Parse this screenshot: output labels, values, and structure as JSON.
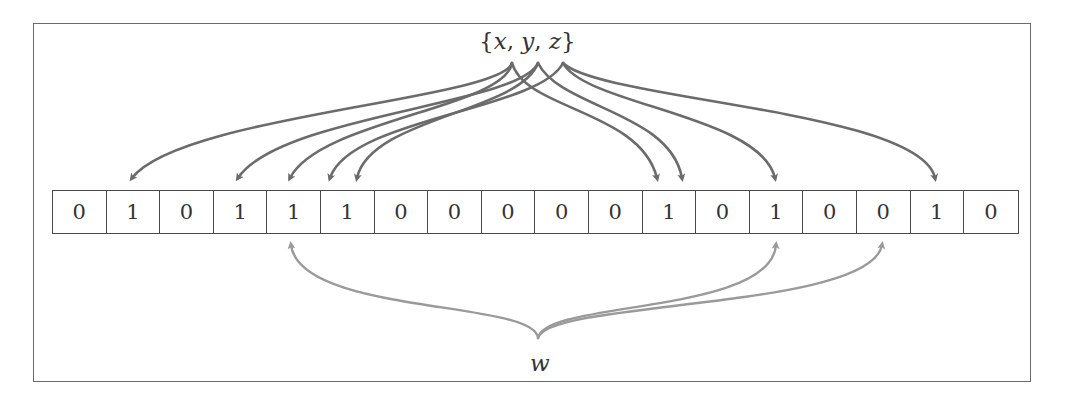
{
  "diagram": {
    "top_label": {
      "open_brace": "{",
      "elements": [
        "x",
        "y",
        "z"
      ],
      "separator": ", ",
      "close_brace": "}"
    },
    "bottom_label": "w",
    "bits": [
      0,
      1,
      0,
      1,
      1,
      1,
      0,
      0,
      0,
      0,
      0,
      1,
      0,
      1,
      0,
      0,
      1,
      0
    ],
    "inserted_arrows": [
      {
        "from": "x",
        "to_index": 1
      },
      {
        "from": "x",
        "to_index": 4
      },
      {
        "from": "x",
        "to_index": 11
      },
      {
        "from": "y",
        "to_index": 3
      },
      {
        "from": "y",
        "to_index": 12
      },
      {
        "from": "y",
        "to_index": 16
      },
      {
        "from": "z",
        "to_index": 5
      },
      {
        "from": "z",
        "to_index": 11
      },
      {
        "from": "z",
        "to_index": 13
      }
    ],
    "query_arrows": [
      {
        "from": "w",
        "to_index": 4
      },
      {
        "from": "w",
        "to_index": 13
      },
      {
        "from": "w",
        "to_index": 15
      }
    ],
    "colors": {
      "insert_arrow": "#6b6b6b",
      "query_arrow": "#9a9a9a",
      "border": "#4a4a4a",
      "text": "#333333"
    }
  }
}
